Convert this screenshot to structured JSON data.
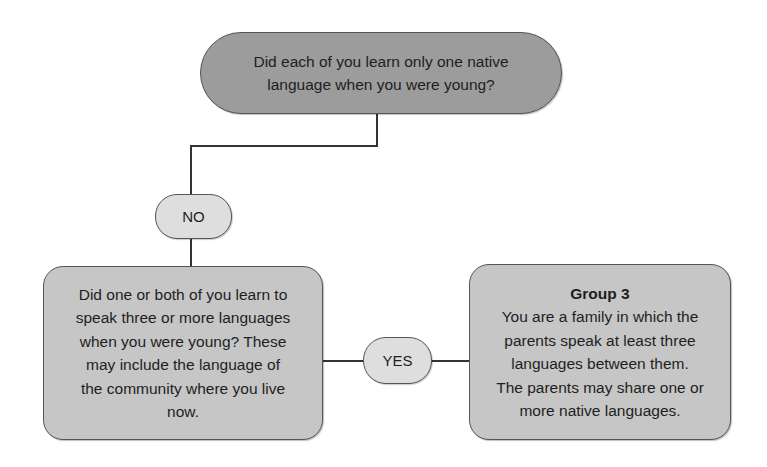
{
  "diagram": {
    "type": "flowchart",
    "nodes": {
      "question_top": {
        "text": "Did each of you learn only one native language when you were young?",
        "lines": [
          "Did each of you learn only one native",
          "language when you were young?"
        ],
        "shape": "stadium",
        "fill": "#9c9c9c"
      },
      "question_left": {
        "text": "Did one or both of you learn to speak three or more languages when you were young? These may include the language of the community where you live now.",
        "lines": [
          "Did one or both of you learn to",
          "speak three or more languages",
          "when you were young? These",
          "may include the language of",
          "the community where you live",
          "now."
        ],
        "shape": "rounded-rectangle",
        "fill": "#c6c6c6"
      },
      "result_right": {
        "title": "Group 3",
        "lines": [
          "You are a family in which the",
          "parents speak at least three",
          "languages between them.",
          "The parents may share one or",
          "more native languages."
        ],
        "shape": "rounded-rectangle",
        "fill": "#c6c6c6"
      }
    },
    "edges": [
      {
        "from": "question_top",
        "to": "question_left",
        "label": "NO"
      },
      {
        "from": "question_left",
        "to": "result_right",
        "label": "YES"
      }
    ],
    "labels": {
      "no": "NO",
      "yes": "YES"
    },
    "colors": {
      "line": "#333333",
      "border": "#555555",
      "bubble_fill": "#dedede"
    }
  }
}
